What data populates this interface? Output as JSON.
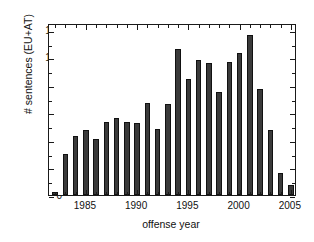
{
  "chart_data": {
    "type": "bar",
    "title": "",
    "xlabel": "offense year",
    "ylabel": "# sentences (EU+AT)",
    "categories": [
      1982,
      1983,
      1984,
      1985,
      1986,
      1987,
      1988,
      1989,
      1990,
      1991,
      1992,
      1993,
      1994,
      1995,
      1996,
      1997,
      1998,
      1999,
      2000,
      2001,
      2002,
      2003,
      2004,
      2005
    ],
    "values": [
      2,
      30,
      43,
      47,
      41,
      53,
      56,
      53,
      52,
      67,
      48,
      66,
      106,
      84,
      98,
      96,
      75,
      97,
      103,
      116,
      77,
      47,
      16,
      7
    ],
    "series": [
      {
        "name": "# sentences (EU+AT)",
        "values": [
          2,
          30,
          43,
          47,
          41,
          53,
          56,
          53,
          52,
          67,
          48,
          66,
          106,
          84,
          98,
          96,
          75,
          97,
          103,
          116,
          77,
          47,
          16,
          7
        ]
      }
    ],
    "xlim": [
      1981.4,
      2005.6
    ],
    "ylim": [
      0,
      125
    ],
    "y_ticks": [
      0,
      20,
      40,
      60,
      80,
      100,
      120
    ],
    "y_tick_labels": [
      "0",
      "20",
      "40",
      "60",
      "80",
      "100",
      "120"
    ],
    "y_minor_step": 10,
    "x_ticks": [
      1985,
      1990,
      1995,
      2000,
      2005
    ],
    "x_tick_labels": [
      "1985",
      "1990",
      "1995",
      "2000",
      "2005"
    ],
    "x_minor_step": 1,
    "grid": false,
    "legend": null,
    "legend_position": "none",
    "bar_color": "#3a3a3a",
    "bar_edge_color": "#111111",
    "axis_color": "#1a1a1a",
    "background": "#ffffff"
  }
}
